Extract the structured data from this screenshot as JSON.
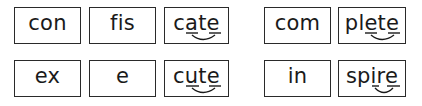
{
  "rows": [
    {
      "left": [
        {
          "text": "con",
          "marked": false
        },
        {
          "text": "fis",
          "marked": false
        },
        {
          "text": "cate",
          "marked": true,
          "vowel": "a",
          "prefix": "c",
          "mid": "t",
          "final_e": "e"
        }
      ],
      "right": [
        {
          "text": "com",
          "marked": false
        },
        {
          "text": "plete",
          "marked": true,
          "vowel": "e",
          "prefix": "pl",
          "mid": "t",
          "final_e": "e"
        }
      ]
    },
    {
      "left": [
        {
          "text": "ex",
          "marked": false
        },
        {
          "text": "e",
          "marked": false
        },
        {
          "text": "cute",
          "marked": true,
          "vowel": "u",
          "prefix": "c",
          "mid": "t",
          "final_e": "e"
        }
      ],
      "right": [
        {
          "text": "in",
          "marked": false
        },
        {
          "text": "spire",
          "marked": true,
          "vowel": "i",
          "prefix": "sp",
          "mid": "r",
          "final_e": "e"
        }
      ]
    }
  ],
  "colors": {
    "ink": "#1a1a1a",
    "border": "#2a2a2a",
    "background": "#ffffff"
  }
}
